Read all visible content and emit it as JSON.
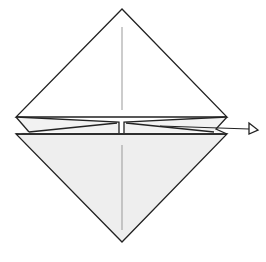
{
  "diagram": {
    "type": "origami-fold-step",
    "colors": {
      "stroke": "#222222",
      "crease": "#888888",
      "paper_front": "#ffffff",
      "paper_back": "#eeeeee"
    },
    "elements": [
      {
        "name": "top-triangle",
        "shape": "triangle",
        "fill": "white"
      },
      {
        "name": "bottom-triangle",
        "shape": "triangle",
        "fill": "light-gray"
      },
      {
        "name": "center-crease-top",
        "shape": "line",
        "style": "crease"
      },
      {
        "name": "center-crease-bottom",
        "shape": "line",
        "style": "crease"
      },
      {
        "name": "left-folded-strip",
        "shape": "polygon"
      },
      {
        "name": "right-folded-strip",
        "shape": "polygon"
      },
      {
        "name": "pull-arrow",
        "shape": "arrow",
        "direction": "right",
        "head": "hollow"
      }
    ]
  }
}
